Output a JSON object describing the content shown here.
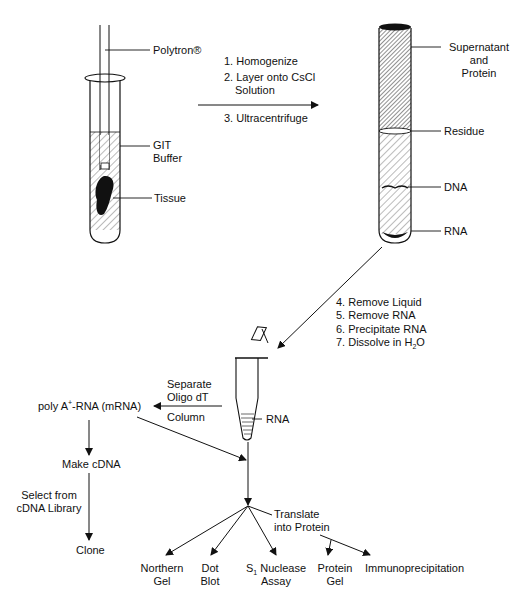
{
  "diagram": {
    "type": "flowchart",
    "left_tube_labels": {
      "polytron": "Polytron®",
      "git_buffer_line1": "GIT",
      "git_buffer_line2": "Buffer",
      "tissue": "Tissue"
    },
    "steps_1_3": {
      "step1": "1. Homogenize",
      "step2_line1": "2. Layer onto CsCl",
      "step2_line2": "Solution",
      "step3": "3. Ultracentrifuge"
    },
    "right_tube_labels": {
      "supernatant_line1": "Supernatant",
      "supernatant_line2": "and",
      "supernatant_line3": "Protein",
      "residue": "Residue",
      "dna": "DNA",
      "rna": "RNA"
    },
    "steps_4_7": {
      "step4": "4. Remove Liquid",
      "step5": "5. Remove RNA",
      "step6": "6. Precipitate RNA",
      "step7_prefix": "7. Dissolve in H",
      "step7_sub": "2",
      "step7_suffix": "O"
    },
    "microtube_label": "RNA",
    "separation": {
      "line1": "Separate",
      "line2": "Oligo dT",
      "line3": "Column"
    },
    "poly_a": {
      "prefix": "poly A",
      "sup": "+",
      "suffix": "-RNA (mRNA)"
    },
    "make_cdna": "Make cDNA",
    "select_line1": "Select from",
    "select_line2": "cDNA Library",
    "clone": "Clone",
    "translate_line1": "Translate",
    "translate_line2": "into Protein",
    "outputs": {
      "northern_line1": "Northern",
      "northern_line2": "Gel",
      "dot_line1": "Dot",
      "dot_line2": "Blot",
      "s1_prefix": "S",
      "s1_sub": "1",
      "s1_suffix": " Nuclease",
      "s1_line2": "Assay",
      "protein_line1": "Protein",
      "protein_line2": "Gel",
      "immuno": "Immunoprecipitation"
    }
  }
}
